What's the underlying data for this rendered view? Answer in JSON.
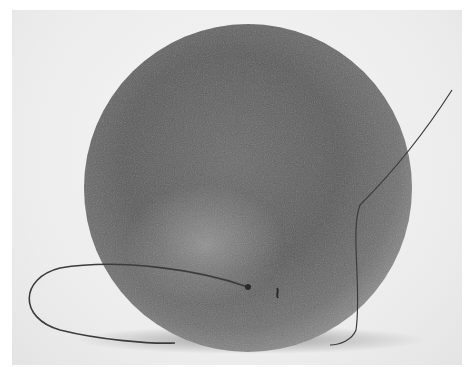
{
  "image": {
    "subject": "textured-sphere-with-fiber",
    "colors": {
      "background": "#efefef",
      "sphere_dark": "#4a4a4a",
      "sphere_mid": "#6e6e6e",
      "sphere_highlight": "#bdbdbd",
      "shadow": "#9a9a9a",
      "fiber": "#3a3a3a"
    }
  }
}
